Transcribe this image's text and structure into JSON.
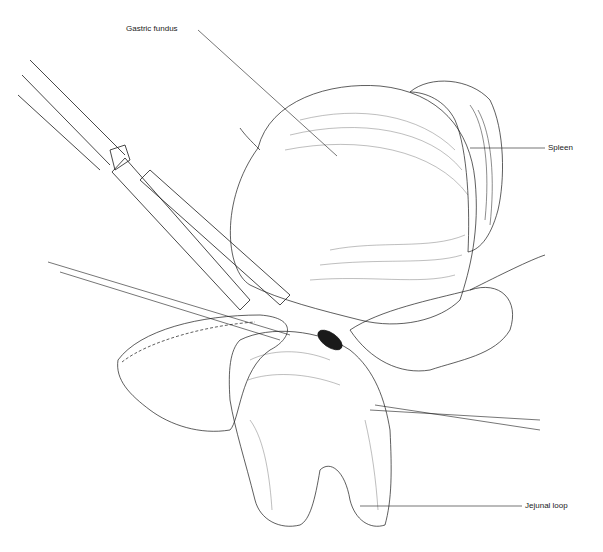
{
  "figure": {
    "type": "surgical illustration",
    "labels": [
      {
        "id": "gastric-fundus",
        "text": "Gastric fundus"
      },
      {
        "id": "spleen",
        "text": "Spleen"
      },
      {
        "id": "jejunal-loop",
        "text": "Jejunal loop"
      }
    ],
    "colors": {
      "ink": "#1a1a1a",
      "background": "#ffffff"
    }
  }
}
